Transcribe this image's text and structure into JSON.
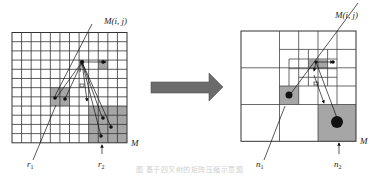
{
  "diagram": {
    "type": "grid-to-quadtree transformation",
    "left_panel": {
      "grid_rows": 12,
      "grid_cols": 12,
      "matrix_label": "M",
      "cell_label": "M(i, j)",
      "region_labels": [
        "r",
        "r"
      ],
      "region_subscripts": [
        "1",
        "2"
      ]
    },
    "arrow": {
      "direction": "right",
      "color": "#6b6b6b"
    },
    "right_panel": {
      "matrix_label": "M",
      "cell_label": "M(i, j)",
      "node_labels": [
        "n",
        "n"
      ],
      "node_subscripts": [
        "1",
        "2"
      ]
    },
    "caption": "图 基于四叉树的矩阵压缩示意图",
    "colors": {
      "grid_line": "#333333",
      "shaded_cell": "#a6a6a6",
      "dot": "#111111"
    }
  }
}
